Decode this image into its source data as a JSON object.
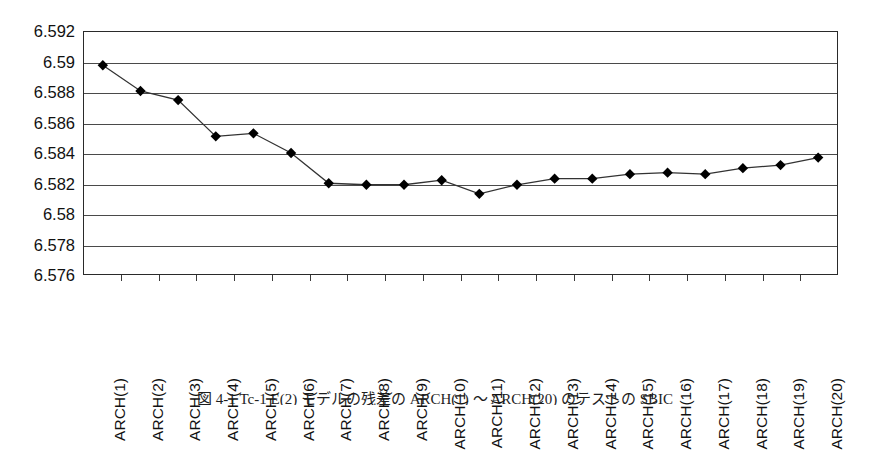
{
  "chart_data": {
    "type": "line",
    "title": "",
    "subtitle": "",
    "xlabel": "",
    "ylabel": "",
    "categories": [
      "ARCH(1)",
      "ARCH(2)",
      "ARCH(3)",
      "ARCH(4)",
      "ARCH(5)",
      "ARCH(6)",
      "ARCH(7)",
      "ARCH(8)",
      "ARCH(9)",
      "ARCH(10)",
      "ARCH(11)",
      "ARCH(12)",
      "ARCH(13)",
      "ARCH(14)",
      "ARCH(15)",
      "ARCH(16)",
      "ARCH(17)",
      "ARCH(18)",
      "ARCH(19)",
      "ARCH(20)"
    ],
    "values": [
      6.5898,
      6.5881,
      6.5875,
      6.5851,
      6.5853,
      6.584,
      6.582,
      6.5819,
      6.5819,
      6.5822,
      6.5813,
      6.5819,
      6.5823,
      6.5823,
      6.5826,
      6.5827,
      6.5826,
      6.583,
      6.5832,
      6.5837
    ],
    "ylim": [
      6.576,
      6.592
    ],
    "yticks": [
      6.576,
      6.578,
      6.58,
      6.582,
      6.584,
      6.586,
      6.588,
      6.59,
      6.592
    ],
    "ytick_labels": [
      "6.576",
      "6.578",
      "6.58",
      "6.582",
      "6.584",
      "6.586",
      "6.588",
      "6.59",
      "6.592"
    ],
    "grid": "horizontal",
    "legend": "none",
    "marker": "diamond",
    "marker_color": "#000000",
    "line_color": "#333333"
  },
  "caption": {
    "text": "図 4-1  Tc-1 E(2) モデルの残差の ARCH(1) ～ ARCH(20) のテストの SBIC"
  }
}
